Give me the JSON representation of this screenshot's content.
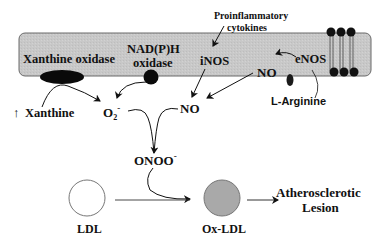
{
  "diagram": {
    "membrane": {
      "fill": "#c8c8c8",
      "stroke": "#6a6a6a"
    },
    "enzymes": {
      "xanthine_oxidase": "Xanthine oxidase",
      "nadph_line1": "NAD(P)H",
      "nadph_line2": "oxidase",
      "inos": "iNOS",
      "enos": "eNOS",
      "no_membrane": "NO"
    },
    "stimuli": {
      "cytokines_line1": "Proinflammatory",
      "cytokines_line2": "cytokines",
      "xanthine_arrow": "↑",
      "xanthine": "Xanthine",
      "l_arginine": "L-Arginine"
    },
    "species": {
      "superoxide_base": "O",
      "superoxide_sub": "2",
      "superoxide_sup": "-",
      "nitric_oxide": "NO",
      "peroxynitrite_base": "ONOO",
      "peroxynitrite_sup": "-"
    },
    "particles": {
      "ldl": "LDL",
      "ox_ldl": "Ox-LDL",
      "ox_ldl_fill": "#a9a9a9"
    },
    "outcome": {
      "line1": "Atherosclerotic",
      "line2": "Lesion"
    }
  }
}
